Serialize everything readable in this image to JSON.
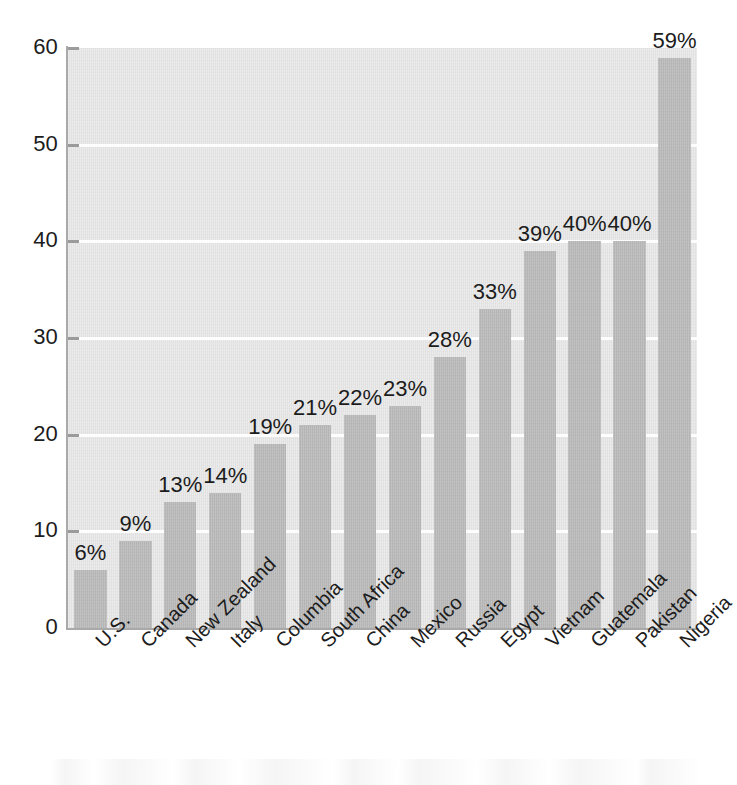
{
  "chart_data": {
    "type": "bar",
    "title": "",
    "xlabel": "",
    "ylabel": "",
    "ylim": [
      0,
      60
    ],
    "ytick_labels": [
      "0",
      "10",
      "20",
      "30",
      "40",
      "50",
      "60"
    ],
    "yticks": [
      0,
      10,
      20,
      30,
      40,
      50,
      60
    ],
    "grid": true,
    "gridlines_at": [
      10,
      20,
      30,
      40,
      50
    ],
    "legend": false,
    "orientation": "vertical",
    "value_label_suffix": "%",
    "categories": [
      "U.S.",
      "Canada",
      "New Zealand",
      "Italy",
      "Columbia",
      "South Africa",
      "China",
      "Mexico",
      "Russia",
      "Egypt",
      "Vietnam",
      "Guatemala",
      "Pakistan",
      "Nigeria"
    ],
    "values": [
      6,
      9,
      13,
      14,
      19,
      21,
      22,
      23,
      28,
      33,
      39,
      40,
      40,
      59
    ],
    "data_labels": [
      "6%",
      "9%",
      "13%",
      "14%",
      "19%",
      "21%",
      "22%",
      "23%",
      "28%",
      "33%",
      "39%",
      "40%",
      "40%",
      "59%"
    ],
    "colors": {
      "bar": "#b6b6b6",
      "plot_background": "#e3e3e3",
      "page_background": "#ffffff",
      "gridline": "#fdfdfd",
      "axis_line": "#a9a9a9",
      "tick_mark": "#9b9b9b",
      "label_text": "#1c1c1c"
    }
  }
}
